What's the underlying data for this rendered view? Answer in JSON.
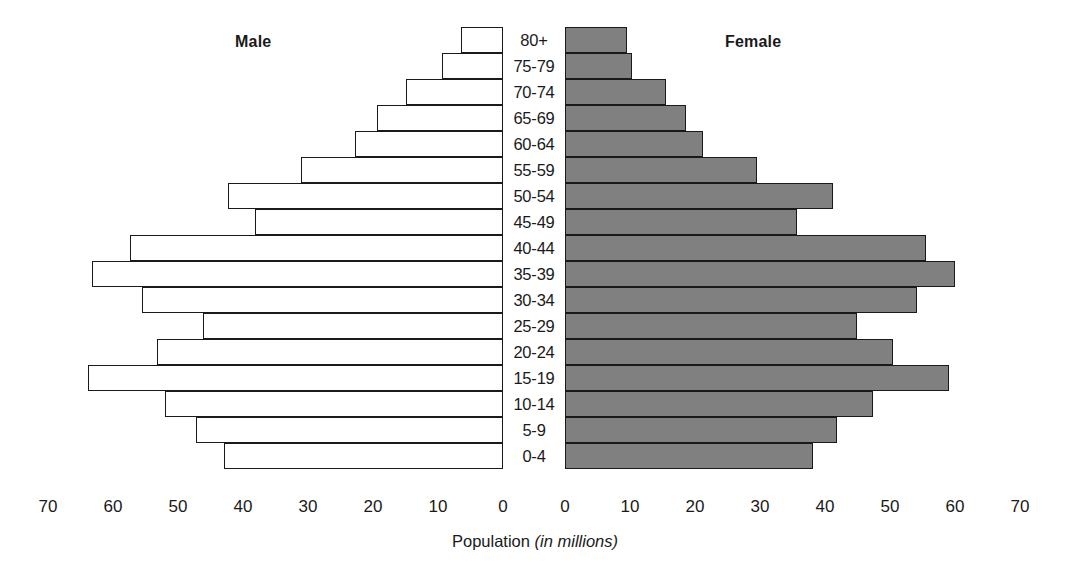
{
  "chart_data": {
    "type": "bar",
    "title": "",
    "subtitle": "",
    "xlabel": "Population (in millions)",
    "xlabel_plain": "Population",
    "xlabel_italic": "(in millions)",
    "ylabel": "",
    "orientation": "horizontal-diverging",
    "grid": false,
    "legend_position": "top-inline",
    "left_header": "Male",
    "right_header": "Female",
    "xlim": [
      0,
      70
    ],
    "x_ticks_left": [
      "70",
      "60",
      "50",
      "40",
      "30",
      "20",
      "10",
      "0"
    ],
    "x_ticks_right": [
      "0",
      "10",
      "20",
      "30",
      "40",
      "50",
      "60",
      "70"
    ],
    "x_tick_values": [
      70,
      60,
      50,
      40,
      30,
      20,
      10,
      0
    ],
    "categories": [
      "80+",
      "75-79",
      "70-74",
      "65-69",
      "60-64",
      "55-59",
      "50-54",
      "45-49",
      "40-44",
      "35-39",
      "30-34",
      "25-29",
      "20-24",
      "15-19",
      "10-14",
      "5-9",
      "0-4"
    ],
    "series": [
      {
        "name": "Male",
        "side": "left",
        "fill": "#ffffff",
        "stroke": "#1a1a1a",
        "values": [
          6.5,
          9.4,
          14.9,
          19.4,
          22.8,
          31.1,
          42.3,
          38.2,
          57.4,
          63.2,
          55.5,
          46.2,
          53.2,
          63.8,
          52.0,
          47.2,
          42.9
        ]
      },
      {
        "name": "Female",
        "side": "right",
        "fill": "#808080",
        "stroke": "#1a1a1a",
        "values": [
          9.5,
          10.3,
          15.5,
          18.6,
          21.2,
          29.5,
          41.2,
          35.7,
          55.5,
          60.0,
          54.2,
          44.9,
          50.5,
          59.1,
          47.4,
          41.8,
          38.2
        ]
      }
    ]
  },
  "colors": {
    "male_fill": "#ffffff",
    "female_fill": "#808080",
    "outline": "#1a1a1a",
    "text": "#1a1a1a",
    "background": "#ffffff"
  }
}
